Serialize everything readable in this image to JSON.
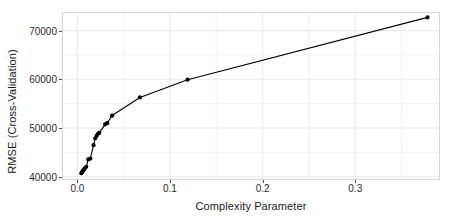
{
  "chart_data": {
    "type": "line",
    "title": "",
    "subtitle": "",
    "xlabel": "Complexity Parameter",
    "ylabel": "RMSE (Cross-Validation)",
    "xlim": [
      -0.0155,
      0.3904
    ],
    "ylim": [
      39530,
      73620
    ],
    "xticks": [
      0.0,
      0.1,
      0.2,
      0.3
    ],
    "xticklabels": [
      "0.0",
      "0.1",
      "0.2",
      "0.3"
    ],
    "yticks": [
      40000,
      50000,
      60000,
      70000
    ],
    "yticklabels": [
      "40000",
      "50000",
      "60000",
      "70000"
    ],
    "grid": true,
    "grid_minor": true,
    "legend": false,
    "legend_position": "none",
    "marker": "filled-circle",
    "marker_color": "#000000",
    "line_color": "#000000",
    "panel_background": "#ffffff",
    "grid_color": "#ebebeb",
    "panel_border_color": "#d6d6d6",
    "series": [
      {
        "name": "RMSE (Cross-Validation)",
        "x": [
          0.0043,
          0.005,
          0.0055,
          0.0062,
          0.007,
          0.0079,
          0.0096,
          0.0118,
          0.014,
          0.0175,
          0.0193,
          0.0209,
          0.0225,
          0.0236,
          0.03,
          0.0322,
          0.0375,
          0.0675,
          0.119,
          0.378
        ],
        "y": [
          40690,
          40900,
          41050,
          41250,
          41450,
          41700,
          42050,
          43560,
          43720,
          46470,
          47900,
          48420,
          48850,
          49000,
          50750,
          51000,
          52560,
          56280,
          59930,
          72720
        ]
      }
    ],
    "points": [
      {
        "x": 0.0043,
        "y": 40690
      },
      {
        "x": 0.005,
        "y": 40900
      },
      {
        "x": 0.0055,
        "y": 41050
      },
      {
        "x": 0.0062,
        "y": 41250
      },
      {
        "x": 0.007,
        "y": 41450
      },
      {
        "x": 0.0079,
        "y": 41700
      },
      {
        "x": 0.0096,
        "y": 42050
      },
      {
        "x": 0.0118,
        "y": 43560
      },
      {
        "x": 0.014,
        "y": 43720
      },
      {
        "x": 0.0175,
        "y": 46470
      },
      {
        "x": 0.0193,
        "y": 47900
      },
      {
        "x": 0.0209,
        "y": 48420
      },
      {
        "x": 0.0225,
        "y": 48850
      },
      {
        "x": 0.0236,
        "y": 49000
      },
      {
        "x": 0.03,
        "y": 50750
      },
      {
        "x": 0.0322,
        "y": 51000
      },
      {
        "x": 0.0375,
        "y": 52560
      },
      {
        "x": 0.0675,
        "y": 56280
      },
      {
        "x": 0.119,
        "y": 59930
      },
      {
        "x": 0.378,
        "y": 72720
      }
    ]
  }
}
